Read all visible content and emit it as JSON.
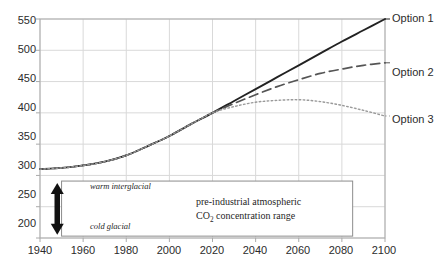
{
  "chart_data": {
    "type": "line",
    "title": "",
    "xlabel": "",
    "ylabel": "",
    "xlim": [
      1940,
      2100
    ],
    "ylim": [
      200,
      550
    ],
    "xticks": [
      1940,
      1960,
      1980,
      2000,
      2020,
      2040,
      2060,
      2080,
      2100
    ],
    "yticks": [
      200,
      250,
      300,
      350,
      400,
      450,
      500,
      550
    ],
    "grid": true,
    "legend_position": "right-inline",
    "series": [
      {
        "name": "Option 1",
        "style": "solid",
        "color": "#222222",
        "x": [
          1940,
          1950,
          1960,
          1970,
          1980,
          1990,
          2000,
          2010,
          2020,
          2030,
          2040,
          2050,
          2060,
          2070,
          2080,
          2090,
          2100
        ],
        "values": [
          310,
          312,
          316,
          322,
          332,
          347,
          363,
          382,
          400,
          419,
          438,
          457,
          476,
          495,
          514,
          532,
          550
        ]
      },
      {
        "name": "Option 2",
        "style": "dashed",
        "color": "#555555",
        "x": [
          1940,
          1950,
          1960,
          1970,
          1980,
          1990,
          2000,
          2010,
          2020,
          2030,
          2040,
          2050,
          2060,
          2070,
          2080,
          2090,
          2100
        ],
        "values": [
          310,
          312,
          316,
          322,
          332,
          347,
          363,
          382,
          400,
          415,
          429,
          442,
          453,
          463,
          470,
          476,
          480
        ]
      },
      {
        "name": "Option 3",
        "style": "dotted",
        "color": "#9a9a9a",
        "x": [
          1940,
          1950,
          1960,
          1970,
          1980,
          1990,
          2000,
          2010,
          2020,
          2030,
          2040,
          2050,
          2060,
          2070,
          2080,
          2090,
          2100
        ],
        "values": [
          310,
          312,
          316,
          322,
          332,
          347,
          363,
          382,
          400,
          410,
          417,
          420,
          421,
          418,
          412,
          404,
          395
        ]
      }
    ],
    "annotations": {
      "range_box": {
        "label_top": "warm interglacial",
        "label_bottom": "cold glacial",
        "center_line_1": "pre-industrial  atmospheric",
        "center_line_2_pre": "CO",
        "center_line_2_sub": "2",
        "center_line_2_post": " concentration  range",
        "x_start": 1950,
        "x_end": 2085,
        "y_low": 203,
        "y_high": 291
      },
      "arrow": {
        "name": "double-headed-vertical-arrow",
        "x": 1948,
        "y_low": 205,
        "y_high": 288
      }
    },
    "colors": {
      "grid": "#d9d9d9",
      "frame": "#aaaaaa",
      "text": "#2b2b2b",
      "box_border": "#8c8c8c"
    }
  },
  "series_labels": {
    "option1": "Option 1",
    "option2": "Option 2",
    "option3": "Option 3"
  },
  "yticks_text": [
    "550",
    "500",
    "450",
    "400",
    "350",
    "300",
    "250",
    "200"
  ],
  "xticks_text": [
    "1940",
    "1960",
    "1980",
    "2000",
    "2020",
    "2040",
    "2060",
    "2080",
    "2100"
  ],
  "box": {
    "warm": "warm interglacial",
    "cold": "cold glacial",
    "line1": "pre-industrial  atmospheric",
    "line2_pre": "CO",
    "line2_sub": "2",
    "line2_post": " concentration  range"
  }
}
